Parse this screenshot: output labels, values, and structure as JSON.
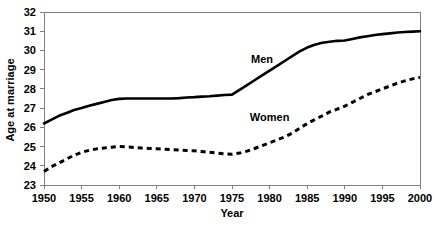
{
  "chart_data": {
    "type": "line",
    "title": "",
    "xlabel": "Year",
    "ylabel": "Age at marriage",
    "xlim": [
      1950,
      2000
    ],
    "ylim": [
      23,
      32
    ],
    "xticks": [
      1950,
      1955,
      1960,
      1965,
      1970,
      1975,
      1980,
      1985,
      1990,
      1995,
      2000
    ],
    "yticks": [
      23,
      24,
      25,
      26,
      27,
      28,
      29,
      30,
      31,
      32
    ],
    "grid": false,
    "legend_position": "inline-annotation",
    "x": [
      1950,
      1951,
      1952,
      1953,
      1954,
      1955,
      1956,
      1957,
      1958,
      1959,
      1960,
      1961,
      1962,
      1963,
      1964,
      1965,
      1966,
      1967,
      1968,
      1969,
      1970,
      1971,
      1972,
      1973,
      1974,
      1975,
      1976,
      1977,
      1978,
      1979,
      1980,
      1981,
      1982,
      1983,
      1984,
      1985,
      1986,
      1987,
      1988,
      1989,
      1990,
      1991,
      1992,
      1993,
      1994,
      1995,
      1996,
      1997,
      1998,
      1999,
      2000
    ],
    "series": [
      {
        "name": "Men",
        "style": "solid",
        "color": "#000000",
        "values": [
          26.2,
          26.4,
          26.6,
          26.75,
          26.9,
          27.0,
          27.12,
          27.22,
          27.32,
          27.42,
          27.48,
          27.5,
          27.5,
          27.5,
          27.5,
          27.5,
          27.5,
          27.5,
          27.52,
          27.55,
          27.57,
          27.6,
          27.62,
          27.65,
          27.68,
          27.7,
          27.95,
          28.2,
          28.45,
          28.7,
          28.95,
          29.2,
          29.45,
          29.7,
          29.95,
          30.15,
          30.3,
          30.4,
          30.45,
          30.5,
          30.52,
          30.6,
          30.68,
          30.74,
          30.8,
          30.85,
          30.89,
          30.93,
          30.96,
          30.98,
          31.0
        ]
      },
      {
        "name": "Women",
        "style": "dashed",
        "color": "#000000",
        "values": [
          23.7,
          23.95,
          24.15,
          24.35,
          24.55,
          24.7,
          24.8,
          24.88,
          24.93,
          24.97,
          25.0,
          24.98,
          24.95,
          24.92,
          24.9,
          24.88,
          24.86,
          24.84,
          24.82,
          24.8,
          24.78,
          24.74,
          24.7,
          24.66,
          24.62,
          24.6,
          24.66,
          24.76,
          24.9,
          25.05,
          25.2,
          25.35,
          25.5,
          25.7,
          25.95,
          26.2,
          26.4,
          26.6,
          26.8,
          26.95,
          27.1,
          27.3,
          27.5,
          27.7,
          27.85,
          28.0,
          28.15,
          28.3,
          28.42,
          28.52,
          28.6
        ]
      }
    ],
    "annotations": [
      {
        "text": "Men",
        "x": 1979,
        "y": 29.35
      },
      {
        "text": "Women",
        "x": 1980,
        "y": 26.35
      }
    ]
  }
}
